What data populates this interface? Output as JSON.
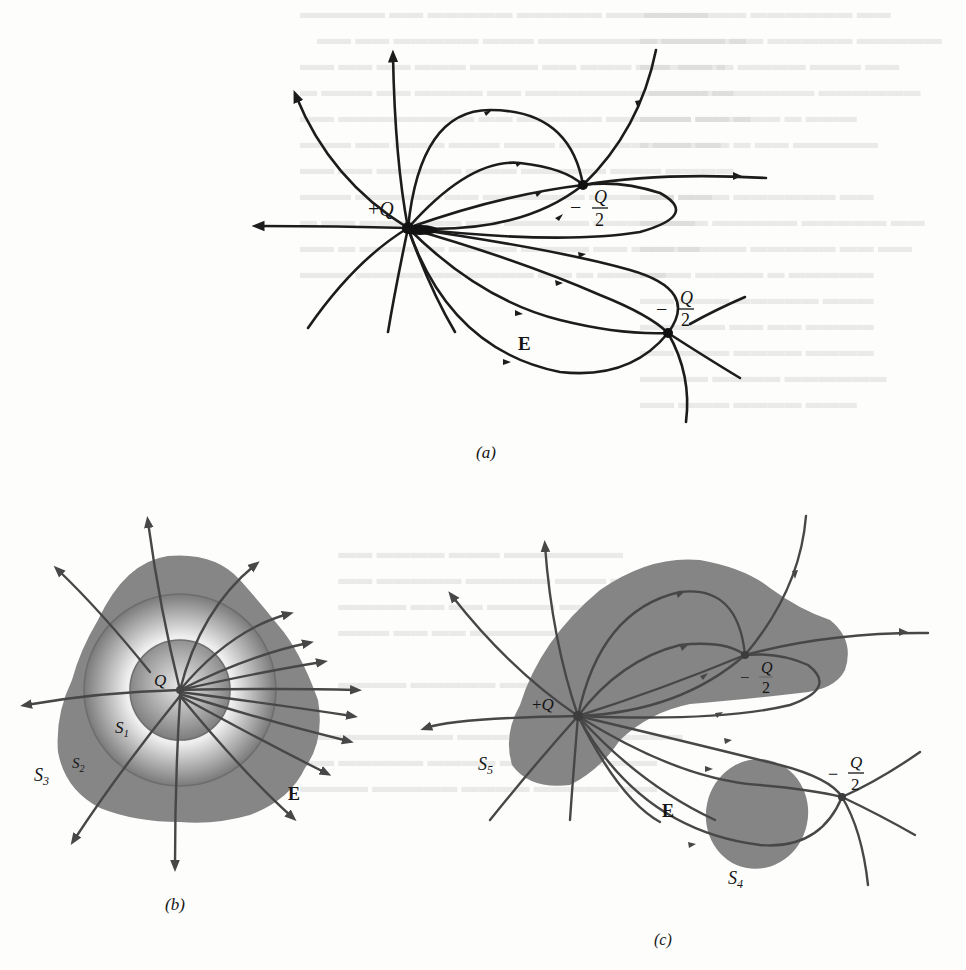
{
  "figure": {
    "panels": [
      {
        "id": "a",
        "caption": "(a)",
        "charges": [
          {
            "label_sign": "+",
            "label_q": "Q",
            "role": "positive source"
          },
          {
            "label_sign": "−",
            "label_num": "Q",
            "label_den": "2",
            "role": "negative sink upper"
          },
          {
            "label_sign": "−",
            "label_num": "Q",
            "label_den": "2",
            "role": "negative sink lower"
          }
        ],
        "field_label": "E"
      },
      {
        "id": "b",
        "caption": "(b)",
        "charge_label": "Q",
        "surfaces": [
          {
            "label": "S",
            "sub": "1"
          },
          {
            "label": "S",
            "sub": "2"
          },
          {
            "label": "S",
            "sub": "3"
          }
        ],
        "field_label": "E"
      },
      {
        "id": "c",
        "caption": "(c)",
        "charges": [
          {
            "label_sign": "+",
            "label_q": "Q"
          },
          {
            "label_sign": "−",
            "label_num": "Q",
            "label_den": "2"
          },
          {
            "label_sign": "−",
            "label_num": "Q",
            "label_den": "2"
          }
        ],
        "surfaces": [
          {
            "label": "S",
            "sub": "5"
          },
          {
            "label": "S",
            "sub": "4"
          }
        ],
        "field_label": "E"
      }
    ],
    "colors": {
      "line_dark": "#1c1c1c",
      "line_gray": "#474747",
      "surface_gray": "#8a8a8a",
      "paper": "#fdfdfc"
    }
  }
}
